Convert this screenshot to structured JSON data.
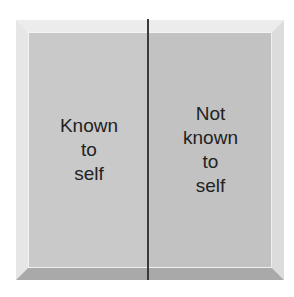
{
  "diagram": {
    "title": "",
    "panes": [
      {
        "id": "known-to-self",
        "lines": [
          "Known",
          "to",
          "self"
        ]
      },
      {
        "id": "not-known-to-self",
        "lines": [
          "Not",
          "known",
          "to",
          "self"
        ]
      }
    ],
    "colors": {
      "left_pane": "#c9c9c9",
      "right_pane": "#c2c2c2",
      "divider": "#3a3a3a",
      "text": "#222222"
    }
  }
}
